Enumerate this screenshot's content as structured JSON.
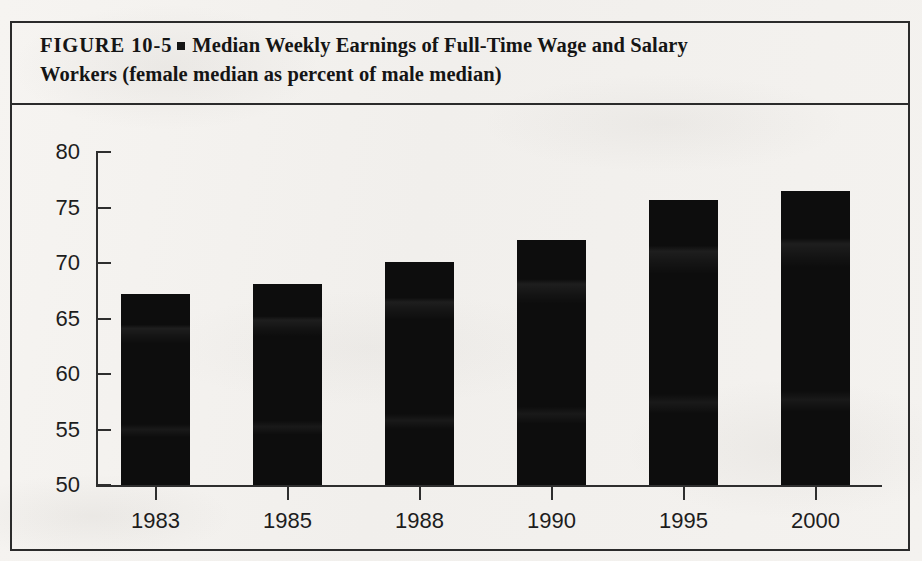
{
  "figure": {
    "label": "FIGURE  10-5",
    "separator_icon": "filled-square-bullet",
    "title_line1": "Median Weekly Earnings of Full-Time Wage and Salary",
    "title_line2": "Workers (female median as percent of male median)"
  },
  "colors": {
    "ink": "#151515",
    "bar": "#0d0d0d",
    "paper": "#f4f2ef",
    "axis": "#2e2e2e"
  },
  "chart_data": {
    "type": "bar",
    "xlabel": "",
    "ylabel": "",
    "categories": [
      "1983",
      "1985",
      "1988",
      "1990",
      "1995",
      "2000"
    ],
    "values": [
      67.2,
      68.1,
      70.1,
      72.1,
      75.7,
      76.5
    ],
    "ylim": [
      50,
      80
    ],
    "yticks": [
      50,
      55,
      60,
      65,
      70,
      75,
      80
    ],
    "ytick_labels": [
      "50",
      "55",
      "60",
      "65",
      "70",
      "75",
      "80"
    ],
    "grid": false,
    "legend": false,
    "series": [
      {
        "name": "Female median as percent of male median",
        "values": [
          67.2,
          68.1,
          70.1,
          72.1,
          75.7,
          76.5
        ]
      }
    ]
  }
}
